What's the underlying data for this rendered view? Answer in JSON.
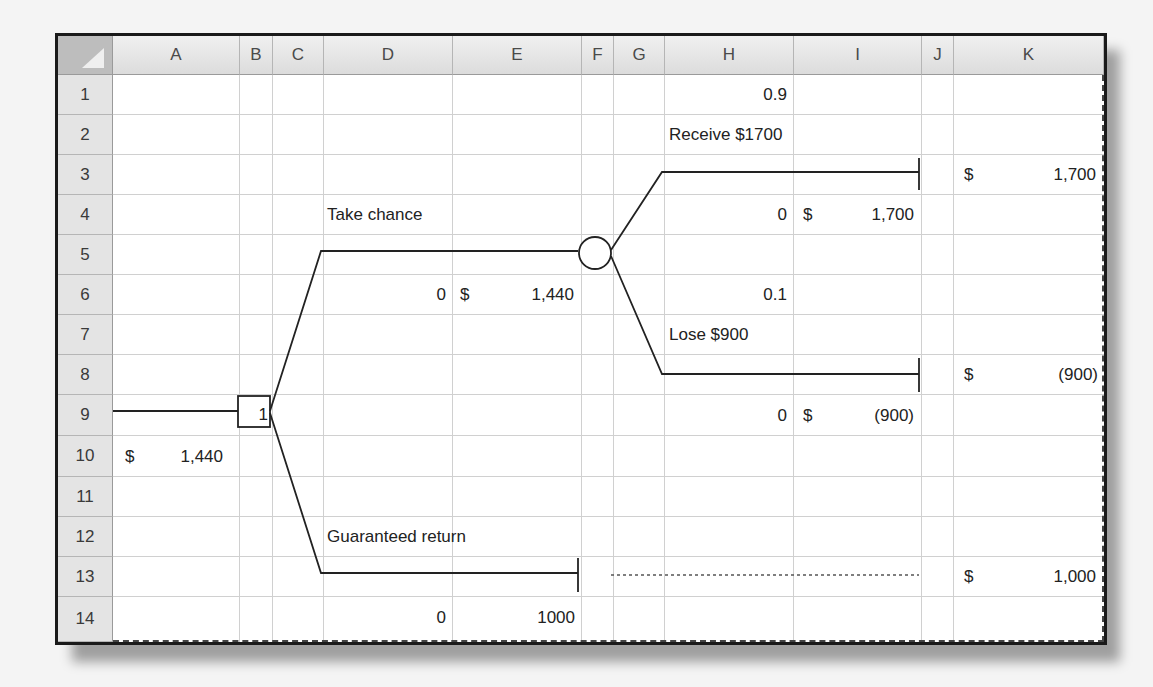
{
  "sheet": {
    "columns": [
      {
        "label": "A",
        "x": 55,
        "w": 127
      },
      {
        "label": "B",
        "x": 182,
        "w": 33
      },
      {
        "label": "C",
        "x": 215,
        "w": 51
      },
      {
        "label": "D",
        "x": 266,
        "w": 129
      },
      {
        "label": "E",
        "x": 395,
        "w": 129
      },
      {
        "label": "F",
        "x": 524,
        "w": 32
      },
      {
        "label": "G",
        "x": 556,
        "w": 51
      },
      {
        "label": "H",
        "x": 607,
        "w": 129
      },
      {
        "label": "I",
        "x": 736,
        "w": 128
      },
      {
        "label": "J",
        "x": 864,
        "w": 32
      },
      {
        "label": "K",
        "x": 896,
        "w": 150
      }
    ],
    "rows": [
      "1",
      "2",
      "3",
      "4",
      "5",
      "6",
      "7",
      "8",
      "9",
      "10",
      "11",
      "12",
      "13",
      "14"
    ]
  },
  "cells": {
    "H1": "0.9",
    "H2": "Receive $1700",
    "K3_sym": "$",
    "K3_val": "1,700",
    "D4": "Take chance",
    "H4": "0",
    "I4_sym": "$",
    "I4_val": "1,700",
    "D6": "0",
    "E6_sym": "$",
    "E6_val": "1,440",
    "H6": "0.1",
    "H7": "Lose $900",
    "K8_sym": "$",
    "K8_val": "(900)",
    "B9": "1",
    "H9": "0",
    "I9_sym": "$",
    "I9_val": "(900)",
    "A10_sym": "$",
    "A10_val": "1,440",
    "D12": "Guaranteed return",
    "K13_sym": "$",
    "K13_val": "1,000",
    "D14": "0",
    "E14": "1000"
  },
  "tree": {
    "decision_node_label": "1",
    "colors": {
      "line": "#222222",
      "grid": "#d0d0d0",
      "header_bg": "#e4e4e4"
    }
  }
}
